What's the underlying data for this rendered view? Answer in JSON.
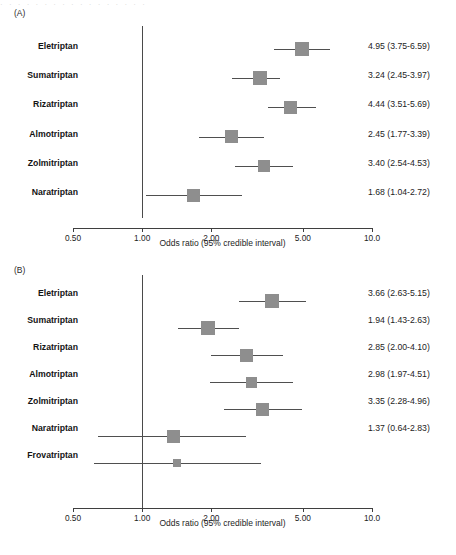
{
  "figure": {
    "top_cut_text": "· · · · · · · · · · · · · · · · ·",
    "marker_color": "#8e8e8e",
    "line_color": "#4f4f4f",
    "axis_color": "#3f3f3f"
  },
  "panels": [
    {
      "tag": "(A)",
      "axis": {
        "title": "Odds ratio (95% credible interval)",
        "scale": "log",
        "ticks": [
          {
            "value": 0.5,
            "label": "0.50"
          },
          {
            "value": 1.0,
            "label": "1.00"
          },
          {
            "value": 2.0,
            "label": "2.00"
          },
          {
            "value": 5.0,
            "label": "5.00"
          },
          {
            "value": 10.0,
            "label": "10.0"
          }
        ],
        "xlim": [
          0.5,
          10.0
        ],
        "reference": 1.0
      },
      "rows": [
        {
          "label": "Eletriptan",
          "value_text": "4.95 (3.75-6.59)",
          "or": 4.95,
          "lo": 3.75,
          "hi": 6.59,
          "size": 14
        },
        {
          "label": "Sumatriptan",
          "value_text": "3.24 (2.45-3.97)",
          "or": 3.24,
          "lo": 2.45,
          "hi": 3.97,
          "size": 14
        },
        {
          "label": "Rizatriptan",
          "value_text": "4.44 (3.51-5.69)",
          "or": 4.44,
          "lo": 3.51,
          "hi": 5.69,
          "size": 13
        },
        {
          "label": "Almotriptan",
          "value_text": "2.45 (1.77-3.39)",
          "or": 2.45,
          "lo": 1.77,
          "hi": 3.39,
          "size": 13
        },
        {
          "label": "Zolmitriptan",
          "value_text": "3.40 (2.54-4.53)",
          "or": 3.4,
          "lo": 2.54,
          "hi": 4.53,
          "size": 12
        },
        {
          "label": "Naratriptan",
          "value_text": "1.68 (1.04-2.72)",
          "or": 1.68,
          "lo": 1.04,
          "hi": 2.72,
          "size": 13
        }
      ]
    },
    {
      "tag": "(B)",
      "axis": {
        "title": "Odds ratio (95% credible interval)",
        "scale": "log",
        "ticks": [
          {
            "value": 0.5,
            "label": "0.50"
          },
          {
            "value": 1.0,
            "label": "1.00"
          },
          {
            "value": 2.0,
            "label": "2.00"
          },
          {
            "value": 5.0,
            "label": "5.00"
          },
          {
            "value": 10.0,
            "label": "10.0"
          }
        ],
        "xlim": [
          0.5,
          10.0
        ],
        "reference": 1.0
      },
      "rows": [
        {
          "label": "Eletriptan",
          "value_text": "3.66 (2.63-5.15)",
          "or": 3.66,
          "lo": 2.63,
          "hi": 5.15,
          "size": 14
        },
        {
          "label": "Sumatriptan",
          "value_text": "1.94 (1.43-2.63)",
          "or": 1.94,
          "lo": 1.43,
          "hi": 2.63,
          "size": 14
        },
        {
          "label": "Rizatriptan",
          "value_text": "2.85 (2.00-4.10)",
          "or": 2.85,
          "lo": 2.0,
          "hi": 4.1,
          "size": 13
        },
        {
          "label": "Almotriptan",
          "value_text": "2.98 (1.97-4.51)",
          "or": 2.98,
          "lo": 1.97,
          "hi": 4.51,
          "size": 11
        },
        {
          "label": "Zolmitriptan",
          "value_text": "3.35 (2.28-4.96)",
          "or": 3.35,
          "lo": 2.28,
          "hi": 4.96,
          "size": 13
        },
        {
          "label": "Naratriptan",
          "value_text": "1.37 (0.64-2.83)",
          "or": 1.37,
          "lo": 0.64,
          "hi": 2.83,
          "size": 13
        },
        {
          "label": "Frovatriptan",
          "value_text": "",
          "or": 1.42,
          "lo": 0.62,
          "hi": 3.3,
          "size": 8
        }
      ]
    }
  ],
  "chart_data": {
    "type": "scatter",
    "xlabel": "Odds ratio (95% credible interval)",
    "ylabel": "",
    "xscale": "log",
    "xlim": [
      0.5,
      10.0
    ],
    "xticks": [
      0.5,
      1.0,
      2.0,
      5.0,
      10.0
    ],
    "xticklabels": [
      "0.50",
      "1.00",
      "2.00",
      "5.00",
      "10.0"
    ],
    "grid": false,
    "legend": "none",
    "reference_line": 1.0,
    "panels": [
      {
        "panel": "(A)",
        "categories": [
          "Eletriptan",
          "Sumatriptan",
          "Rizatriptan",
          "Almotriptan",
          "Zolmitriptan",
          "Naratriptan"
        ],
        "values": [
          4.95,
          3.24,
          4.44,
          2.45,
          3.4,
          1.68
        ],
        "ci_low": [
          3.75,
          2.45,
          3.51,
          1.77,
          2.54,
          1.04
        ],
        "ci_high": [
          6.59,
          3.97,
          5.69,
          3.39,
          4.53,
          2.72
        ],
        "labels": [
          "4.95 (3.75-6.59)",
          "3.24 (2.45-3.97)",
          "4.44 (3.51-5.69)",
          "2.45 (1.77-3.39)",
          "3.40 (2.54-4.53)",
          "1.68 (1.04-2.72)"
        ]
      },
      {
        "panel": "(B)",
        "categories": [
          "Eletriptan",
          "Sumatriptan",
          "Rizatriptan",
          "Almotriptan",
          "Zolmitriptan",
          "Naratriptan",
          "Frovatriptan"
        ],
        "values": [
          3.66,
          1.94,
          2.85,
          2.98,
          3.35,
          1.37,
          1.42
        ],
        "ci_low": [
          2.63,
          1.43,
          2.0,
          1.97,
          2.28,
          0.64,
          0.62
        ],
        "ci_high": [
          5.15,
          2.63,
          4.1,
          4.51,
          4.96,
          2.83,
          3.3
        ],
        "labels": [
          "3.66 (2.63-5.15)",
          "1.94 (1.43-2.63)",
          "2.85 (2.00-4.10)",
          "2.98 (1.97-4.51)",
          "3.35 (2.28-4.96)",
          "1.37 (0.64-2.83)",
          ""
        ]
      }
    ]
  }
}
